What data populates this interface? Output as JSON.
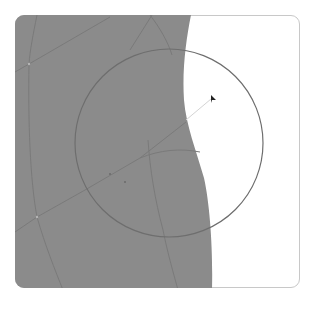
{
  "map": {
    "colors": {
      "land": "#8b8b8b",
      "water": "#ffffff",
      "road": "#7a7a7a",
      "radius_circle": "#6e6e6e",
      "frame_border": "#c8c8c8",
      "marker": "#222222",
      "pointer_line": "#d8d8d8"
    },
    "radius_circle": {
      "center_x": 169,
      "center_y": 143,
      "radius": 94
    },
    "marker": {
      "icon": "pointer-arrow-icon",
      "x": 213,
      "y": 97
    }
  }
}
